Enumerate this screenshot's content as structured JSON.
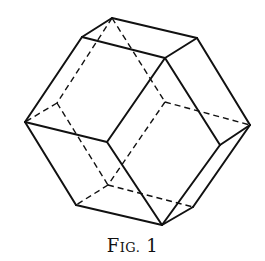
{
  "figure": {
    "caption_prefix_big": "F",
    "caption_prefix_small": "IG.",
    "caption_number": "1",
    "line_color": "#111111",
    "background": "#ffffff"
  }
}
